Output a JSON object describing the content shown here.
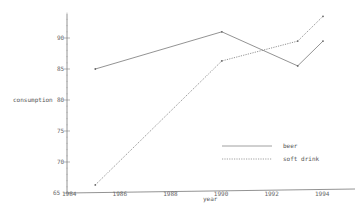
{
  "chart_data": {
    "type": "line",
    "title": "",
    "xlabel": "year",
    "ylabel": "consumption",
    "xlim": [
      1983.6,
      1995.1
    ],
    "ylim": [
      65,
      94
    ],
    "xticks": [
      1984,
      1986,
      1988,
      1990,
      1992,
      1994
    ],
    "yticks": [
      65,
      70,
      75,
      80,
      85,
      90
    ],
    "grid": false,
    "legend_position": "lower right",
    "series": [
      {
        "name": "beer",
        "style": "solid",
        "x": [
          1985,
          1990,
          1993,
          1994
        ],
        "values": [
          85,
          91,
          85.5,
          89.5
        ]
      },
      {
        "name": "soft drink",
        "style": "dotted",
        "x": [
          1985,
          1990,
          1993,
          1994
        ],
        "values": [
          66.3,
          86.3,
          89.5,
          93.5
        ]
      }
    ]
  },
  "labels": {
    "xlabel": "year",
    "ylabel": "consumption",
    "legend": [
      "beer",
      "soft drink"
    ],
    "xticks": [
      "1984",
      "1986",
      "1988",
      "1990",
      "1992",
      "1994"
    ],
    "yticks": [
      "65",
      "70",
      "75",
      "80",
      "85",
      "90"
    ]
  }
}
